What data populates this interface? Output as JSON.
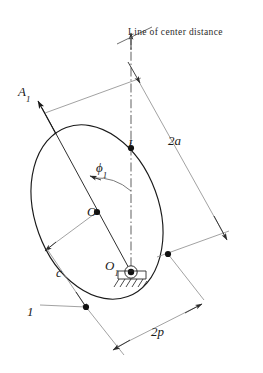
{
  "figure": {
    "title_text": "Line of center distance",
    "background_color": "#ffffff",
    "stroke_color": "#1a1a1a",
    "thin_stroke_color": "#8a8a8a",
    "labels": {
      "line_of_center_distance": "Line of center distance",
      "vertex_A1": "A",
      "vertex_A1_sub": "1",
      "point_I": "I",
      "angle_phi1": "ϕ",
      "angle_phi1_sub": "1",
      "center_O": "O",
      "pivot_O1": "O",
      "pivot_O1_sub": "1",
      "dim_c": "c",
      "curve_number_1": "1",
      "dim_2a": "2a",
      "dim_2p": "2p"
    },
    "geometry": {
      "ellipse_center_x": 97,
      "ellipse_center_y": 212,
      "ellipse_radius_x": 62,
      "ellipse_radius_y": 90,
      "ellipse_rotation_deg": -20,
      "center_line_x": 131,
      "center_line_top_y": 32,
      "center_line_bottom_y": 272,
      "pivot_x": 131,
      "pivot_y": 272,
      "point_I_x": 131,
      "point_I_y": 148,
      "point_O_x": 97,
      "point_O_y": 212,
      "angle_phi1_degrees": 20
    },
    "icons": {
      "ground_support": "hatched-ground-icon",
      "pivot_joint": "pin-joint-icon",
      "arrow_A1": "arrow-up-left-icon",
      "arrow_center_line": "arrow-up-icon"
    }
  }
}
